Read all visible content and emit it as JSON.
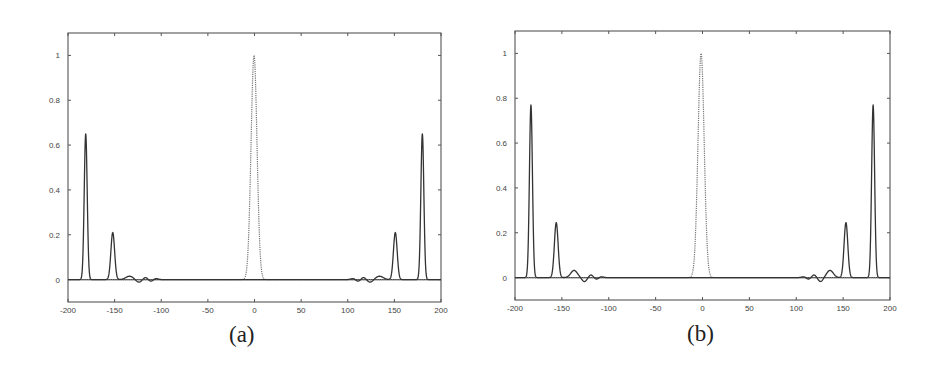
{
  "figure": {
    "panels": [
      {
        "caption": "(a)"
      },
      {
        "caption": "(b)"
      }
    ]
  },
  "chart_data": [
    {
      "type": "line",
      "title": "",
      "caption": "(a)",
      "xlabel": "",
      "ylabel": "",
      "xlim": [
        -200,
        200
      ],
      "ylim": [
        -0.1,
        1.1
      ],
      "xticks": [
        -200,
        -150,
        -100,
        -50,
        0,
        50,
        100,
        150,
        200
      ],
      "xtick_labels": [
        "-200",
        "-150",
        "-100",
        "-50",
        "0",
        "50",
        "100",
        "150",
        "200"
      ],
      "yticks": [
        0,
        0.2,
        0.4,
        0.6,
        0.8,
        1
      ],
      "ytick_labels": [
        "0",
        "0.2",
        "0.4",
        "0.6",
        "0.8",
        "1"
      ],
      "grid": false,
      "legend": null,
      "series": [
        {
          "name": "central peak (dotted)",
          "style": "dotted",
          "peaks": [
            {
              "x": -0.5,
              "height": 1.0,
              "width": 3.2
            }
          ]
        },
        {
          "name": "side peaks (solid)",
          "style": "solid",
          "peaks": [
            {
              "x": -181,
              "height": 0.65,
              "width": 1.6
            },
            {
              "x": -152,
              "height": 0.21,
              "width": 2.0
            },
            {
              "x": -134,
              "height": 0.015,
              "width": 4
            },
            {
              "x": -124,
              "height": -0.012,
              "width": 3
            },
            {
              "x": -117,
              "height": 0.01,
              "width": 2.5
            },
            {
              "x": -111,
              "height": -0.008,
              "width": 2.5
            },
            {
              "x": -106,
              "height": 0.005,
              "width": 2.5
            },
            {
              "x": 106,
              "height": 0.005,
              "width": 2.5
            },
            {
              "x": 111,
              "height": -0.008,
              "width": 2.5
            },
            {
              "x": 117,
              "height": 0.01,
              "width": 2.5
            },
            {
              "x": 124,
              "height": -0.012,
              "width": 3
            },
            {
              "x": 134,
              "height": 0.015,
              "width": 4
            },
            {
              "x": 151,
              "height": 0.21,
              "width": 2.0
            },
            {
              "x": 180,
              "height": 0.65,
              "width": 1.6
            }
          ]
        }
      ]
    },
    {
      "type": "line",
      "title": "",
      "caption": "(b)",
      "xlabel": "",
      "ylabel": "",
      "xlim": [
        -200,
        200
      ],
      "ylim": [
        -0.1,
        1.1
      ],
      "xticks": [
        -200,
        -150,
        -100,
        -50,
        0,
        50,
        100,
        150,
        200
      ],
      "xtick_labels": [
        "-200",
        "-150",
        "-100",
        "-50",
        "0",
        "50",
        "100",
        "150",
        "200"
      ],
      "yticks": [
        0,
        0.2,
        0.4,
        0.6,
        0.8,
        1
      ],
      "ytick_labels": [
        "0",
        "0.2",
        "0.4",
        "0.6",
        "0.8",
        "1"
      ],
      "grid": false,
      "legend": null,
      "series": [
        {
          "name": "central peak (dotted)",
          "style": "dotted",
          "peaks": [
            {
              "x": -1.5,
              "height": 1.0,
              "width": 3.3
            }
          ]
        },
        {
          "name": "side peaks (solid)",
          "style": "solid",
          "peaks": [
            {
              "x": -183,
              "height": 0.77,
              "width": 1.6
            },
            {
              "x": -156,
              "height": 0.245,
              "width": 2.0
            },
            {
              "x": -137,
              "height": 0.032,
              "width": 3.5
            },
            {
              "x": -126,
              "height": -0.018,
              "width": 2.5
            },
            {
              "x": -119,
              "height": 0.012,
              "width": 2.2
            },
            {
              "x": -113,
              "height": -0.007,
              "width": 2.2
            },
            {
              "x": -108,
              "height": 0.004,
              "width": 2.2
            },
            {
              "x": 108,
              "height": 0.004,
              "width": 2.2
            },
            {
              "x": 113,
              "height": -0.007,
              "width": 2.2
            },
            {
              "x": 119,
              "height": 0.012,
              "width": 2.2
            },
            {
              "x": 126,
              "height": -0.018,
              "width": 2.5
            },
            {
              "x": 136,
              "height": 0.032,
              "width": 3.5
            },
            {
              "x": 153,
              "height": 0.245,
              "width": 2.0
            },
            {
              "x": 182,
              "height": 0.77,
              "width": 1.6
            }
          ]
        }
      ]
    }
  ]
}
